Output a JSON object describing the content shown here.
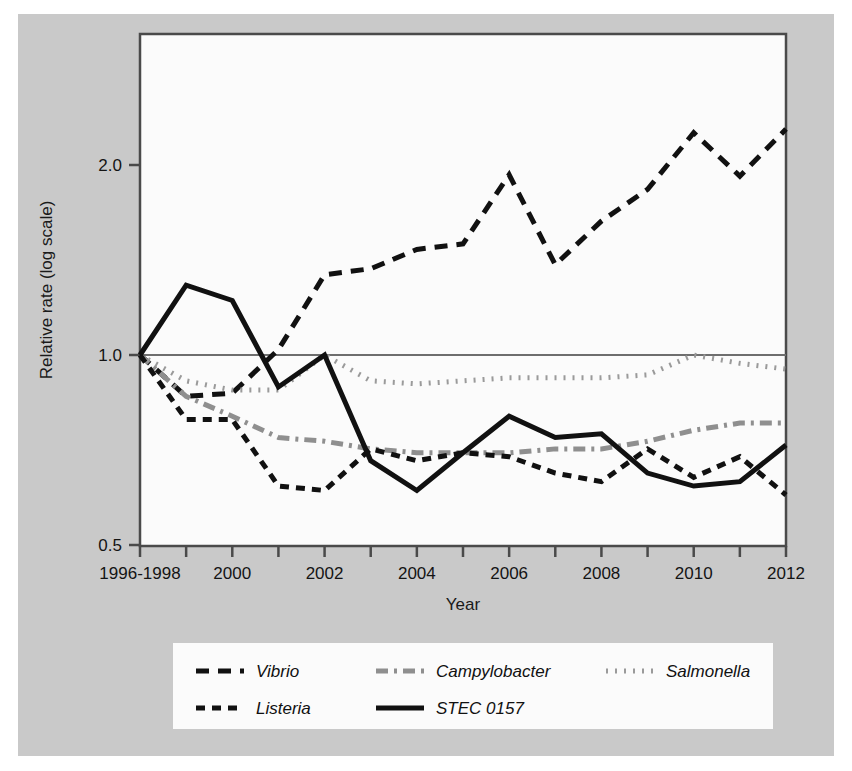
{
  "figure": {
    "background_color": "#c9c9c9",
    "plot_background_color": "#fbfbfb",
    "frame_color": "#4a4a4a"
  },
  "chart_data": {
    "type": "line",
    "title": "",
    "xlabel": "Year",
    "ylabel": "Relative rate (log scale)",
    "scale": "log",
    "grid": false,
    "reference_line": 1.0,
    "legend_position": "bottom",
    "ylim": [
      0.5,
      2.5
    ],
    "yticks": [
      0.5,
      1.0,
      2.0
    ],
    "ytick_labels": [
      "0.5",
      "1.0",
      "2.0"
    ],
    "x": [
      "1996-1998",
      "1999",
      "2000",
      "2001",
      "2002",
      "2003",
      "2004",
      "2005",
      "2006",
      "2007",
      "2008",
      "2009",
      "2010",
      "2011",
      "2012"
    ],
    "xtick_labels": [
      "1996-1998",
      "",
      "2000",
      "",
      "2002",
      "",
      "2004",
      "",
      "2006",
      "",
      "2008",
      "",
      "2010",
      "",
      "2012"
    ],
    "xlim_labels": [
      "1996-1998",
      "2012"
    ],
    "series": [
      {
        "name": "Vibrio",
        "color": "#111111",
        "dash": "long-dash",
        "dasharray": "13,9",
        "width": 5,
        "values": [
          1.0,
          0.86,
          0.87,
          1.02,
          1.34,
          1.37,
          1.47,
          1.5,
          1.93,
          1.39,
          1.63,
          1.83,
          2.25,
          1.92,
          2.28
        ]
      },
      {
        "name": "Campylobacter",
        "color": "#8f8f8f",
        "dash": "dash-dot",
        "dasharray": "12,6,3,6",
        "width": 5,
        "values": [
          1.0,
          0.86,
          0.8,
          0.74,
          0.73,
          0.71,
          0.7,
          0.7,
          0.7,
          0.71,
          0.71,
          0.73,
          0.76,
          0.78,
          0.78
        ]
      },
      {
        "name": "Salmonella",
        "color": "#9a9a9a",
        "dash": "dotted",
        "dasharray": "2,7",
        "width": 5,
        "values": [
          1.0,
          0.91,
          0.88,
          0.88,
          1.0,
          0.91,
          0.9,
          0.91,
          0.92,
          0.92,
          0.92,
          0.93,
          1.0,
          0.97,
          0.95
        ]
      },
      {
        "name": "Listeria",
        "color": "#111111",
        "dash": "short-dash",
        "dasharray": "9,7",
        "width": 5,
        "values": [
          1.0,
          0.79,
          0.79,
          0.62,
          0.61,
          0.71,
          0.68,
          0.7,
          0.69,
          0.65,
          0.63,
          0.71,
          0.64,
          0.69,
          0.6
        ]
      },
      {
        "name": "STEC 0157",
        "color": "#111111",
        "dash": "solid",
        "dasharray": "",
        "width": 5,
        "values": [
          1.0,
          1.29,
          1.22,
          0.89,
          1.0,
          0.68,
          0.61,
          0.7,
          0.8,
          0.74,
          0.75,
          0.65,
          0.62,
          0.63,
          0.72
        ]
      }
    ]
  },
  "legend": {
    "entries": [
      {
        "label": "Vibrio"
      },
      {
        "label": "Campylobacter"
      },
      {
        "label": "Salmonella"
      },
      {
        "label": "Listeria"
      },
      {
        "label": "STEC 0157"
      }
    ]
  }
}
